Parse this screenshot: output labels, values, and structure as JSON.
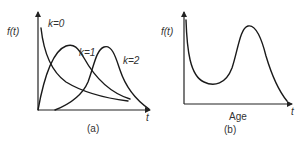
{
  "panels": [
    {
      "id": "a",
      "caption": "(a)",
      "y_axis_label": "f(t)",
      "x_axis_label": "t",
      "curves": [
        {
          "label": "k=0",
          "shape": "monotonic decreasing from y-axis"
        },
        {
          "label": "k=1",
          "shape": "rises from origin, early peak, long right tail"
        },
        {
          "label": "k=2",
          "shape": "delayed start, later peak, decays to axis"
        }
      ]
    },
    {
      "id": "b",
      "caption": "(b)",
      "y_axis_label": "f(t)",
      "x_axis_label": "t",
      "x_axis_title": "Age",
      "curves": [
        {
          "label": "",
          "shape": "bathtub-like: high at start, dip, hump peak, decays to zero"
        }
      ]
    }
  ],
  "colors": {
    "line": "#1a1a1a",
    "text": "#333333",
    "background": "#ffffff"
  }
}
